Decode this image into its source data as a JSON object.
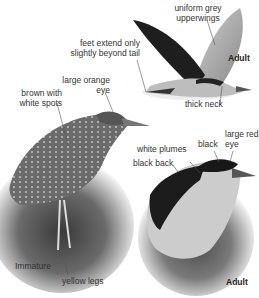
{
  "labels": {
    "uniform_grey": "uniform grey",
    "upperwings": "upperwings",
    "feet_extend_1": "feet extend only",
    "feet_extend_2": "slightly beyond tail",
    "adult_flight": "Adult",
    "thick_neck": "thick neck",
    "large_orange": "large orange",
    "eye_orange": "eye",
    "brown_with": "brown with",
    "white_spots": "white spots",
    "white_plumes": "white plumes",
    "black": "black",
    "large_red": "large red",
    "eye_red": "eye",
    "black_back": "black back",
    "immature": "Immature",
    "yellow_legs": "yellow legs",
    "adult_perched": "Adult"
  },
  "figures": [
    {
      "name": "adult-in-flight",
      "description": "Night heron adult in flight"
    },
    {
      "name": "immature-perched",
      "description": "Immature night heron perched"
    },
    {
      "name": "adult-perched",
      "description": "Adult night heron perched"
    }
  ]
}
